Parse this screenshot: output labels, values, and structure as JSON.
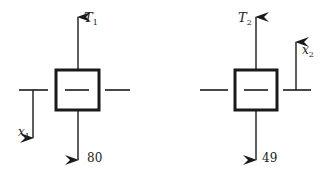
{
  "diagram": {
    "colors": {
      "stroke": "#1a1a1a",
      "background": "#ffffff"
    },
    "left_block": {
      "tension_label": "T",
      "tension_sub": "1",
      "weight_label": "80",
      "displacement_label": "x",
      "displacement_sub": "1",
      "displacement_direction": "down"
    },
    "right_block": {
      "tension_label": "T",
      "tension_sub": "2",
      "weight_label": "49",
      "displacement_label": "x",
      "displacement_sub": "2",
      "displacement_direction": "up"
    }
  }
}
